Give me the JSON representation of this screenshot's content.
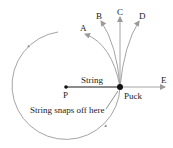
{
  "diagram": {
    "labels": {
      "A": "A",
      "B": "B",
      "C": "C",
      "D": "D",
      "E": "E",
      "P": "P",
      "string": "String",
      "puck": "Puck",
      "snap": "String snaps off here"
    },
    "colors": {
      "path": "#9a9a9a",
      "string": "#666666",
      "dot": "#111111",
      "text": "#222222"
    }
  }
}
